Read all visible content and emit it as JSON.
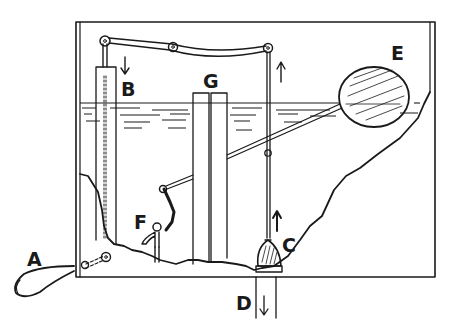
{
  "diagram": {
    "colors": {
      "ink": "#1a1a1a",
      "background": "#ffffff"
    },
    "labels": {
      "A": "A",
      "B": "B",
      "C": "C",
      "D": "D",
      "E": "E",
      "F": "F",
      "G": "G"
    },
    "parts": [
      {
        "id": "A",
        "name": "flush handle (outside tank)"
      },
      {
        "id": "B",
        "name": "tube with rod, arrow pointing down"
      },
      {
        "id": "C",
        "name": "flush valve stopper, arrow pointing up"
      },
      {
        "id": "D",
        "name": "outlet pipe, arrow pointing down"
      },
      {
        "id": "E",
        "name": "float ball"
      },
      {
        "id": "F",
        "name": "inlet valve / faucet"
      },
      {
        "id": "G",
        "name": "overflow tube"
      }
    ],
    "arrows": {
      "B": "down",
      "C": "up",
      "D": "down",
      "rod": "up"
    }
  }
}
